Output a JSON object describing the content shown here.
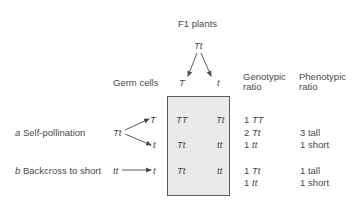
{
  "title": "F1 plants",
  "parent_genotype": "Tt",
  "germ_cells_label": "Germ cells",
  "germ_cells": [
    "T",
    "t"
  ],
  "headers": {
    "genotypic": [
      "Genotypic",
      "ratio"
    ],
    "phenotypic": [
      "Phenotypic",
      "ratio"
    ]
  },
  "crosses": [
    {
      "letter": "a",
      "label": "Self-pollination",
      "genotype": "Tt",
      "gametes": [
        "T",
        "t"
      ],
      "grid": [
        [
          "TT",
          "Tt"
        ],
        [
          "Tt",
          "tt"
        ]
      ],
      "genotypic_ratio": [
        {
          "count": "1",
          "genotype": "TT"
        },
        {
          "count": "2",
          "genotype": "Tt"
        },
        {
          "count": "1",
          "genotype": "tt"
        }
      ],
      "phenotypic_ratio": [
        "3 tall",
        "1 short"
      ]
    },
    {
      "letter": "b",
      "label": "Backcross to short",
      "genotype": "tt",
      "gametes": [
        "t"
      ],
      "grid": [
        [
          "Tt",
          "tt"
        ]
      ],
      "genotypic_ratio": [
        {
          "count": "1",
          "genotype": "Tt"
        },
        {
          "count": "1",
          "genotype": "tt"
        }
      ],
      "phenotypic_ratio": [
        "1 tall",
        "1 short"
      ]
    }
  ]
}
